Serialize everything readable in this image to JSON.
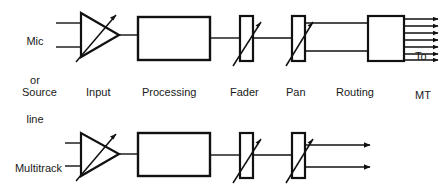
{
  "diagram": {
    "stroke_color": "#111111",
    "text_color": "#1a1a1a",
    "background": "#ffffff",
    "stage_labels": [
      {
        "text": "Source",
        "x": 22,
        "y": 86
      },
      {
        "text": "Input",
        "x": 86,
        "y": 86
      },
      {
        "text": "Processing",
        "x": 142,
        "y": 86
      },
      {
        "text": "Fader",
        "x": 230,
        "y": 86
      },
      {
        "text": "Pan",
        "x": 286,
        "y": 86
      },
      {
        "text": "Routing",
        "x": 336,
        "y": 86
      }
    ],
    "rows": [
      {
        "name": "channel-path",
        "source_label": [
          "Mic",
          "or",
          "line"
        ],
        "source_label_x": 21,
        "source_label_y": 9,
        "destination_label": [
          "To",
          "MT"
        ],
        "destination_label_x": 415,
        "destination_label_y": 24,
        "output_arrow_count": 7,
        "blocks": {
          "amplifier": "input-amplifier-triangle",
          "processing": "processing-block",
          "fader": "fader-element",
          "pan": "pan-element",
          "routing": "routing-matrix-block"
        }
      },
      {
        "name": "monitor-path",
        "source_label": [
          "Multitrack",
          "replay"
        ],
        "source_label_x": 14,
        "source_label_y": 134,
        "destination_label": [
          "To",
          "stereo mix"
        ],
        "destination_label_x": 375,
        "destination_label_y": 138,
        "output_arrow_count": 2,
        "blocks": {
          "amplifier": "input-amplifier-triangle",
          "processing": "processing-block",
          "fader": "fader-element",
          "pan": "pan-element"
        }
      }
    ]
  }
}
